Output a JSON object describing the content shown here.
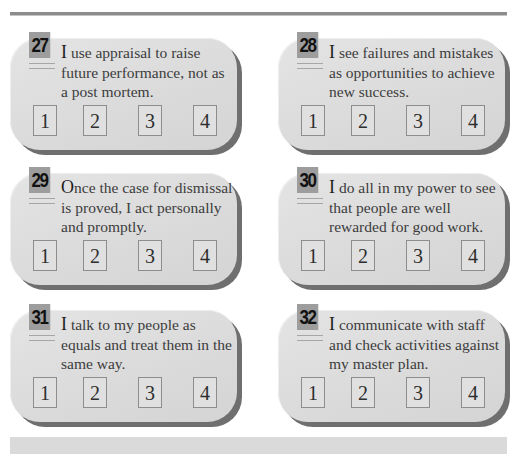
{
  "questions": [
    {
      "number": "27",
      "lead": "I",
      "text": " use appraisal to raise future performance, not as a post mortem.",
      "options": [
        "1",
        "2",
        "3",
        "4"
      ]
    },
    {
      "number": "28",
      "lead": "I",
      "text": " see failures and mistakes as opportunities to achieve new success.",
      "options": [
        "1",
        "2",
        "3",
        "4"
      ]
    },
    {
      "number": "29",
      "lead": "O",
      "text": "nce the case for dismissal is proved, I act personally and promptly.",
      "options": [
        "1",
        "2",
        "3",
        "4"
      ]
    },
    {
      "number": "30",
      "lead": "I",
      "text": " do all in my power to see that people are well rewarded for good work.",
      "options": [
        "1",
        "2",
        "3",
        "4"
      ]
    },
    {
      "number": "31",
      "lead": "I",
      "text": " talk to my people as equals and treat them in the same way.",
      "options": [
        "1",
        "2",
        "3",
        "4"
      ]
    },
    {
      "number": "32",
      "lead": "I",
      "text": " communicate with staff and check activities against my master plan.",
      "options": [
        "1",
        "2",
        "3",
        "4"
      ]
    }
  ],
  "colors": {
    "card_face": "#dadada",
    "card_shadow": "#6f6f6f",
    "badge": "#9d9d9d",
    "rule": "#8c8c8c"
  }
}
